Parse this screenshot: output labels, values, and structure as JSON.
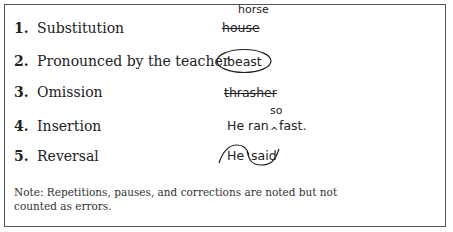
{
  "items": [
    {
      "number": "1.",
      "label": "Substitution",
      "example": "house",
      "annotation": "horse",
      "marking": "strikethrough-with-replacement"
    },
    {
      "number": "2.",
      "label": "Pronounced by the teacher",
      "example": "beast",
      "marking": "circled"
    },
    {
      "number": "3.",
      "label": "Omission",
      "example": "thrasher",
      "marking": "strikethrough"
    },
    {
      "number": "4.",
      "label": "Insertion",
      "example_before": "He ran",
      "example_after": "fast.",
      "annotation": "so",
      "caret": "^",
      "marking": "caret-insertion"
    },
    {
      "number": "5.",
      "label": "Reversal",
      "example_word1": "He",
      "example_word2": "said",
      "marking": "reversal-loop"
    }
  ],
  "note": "Note: Repetitions, pauses, and corrections are noted but not counted as errors."
}
